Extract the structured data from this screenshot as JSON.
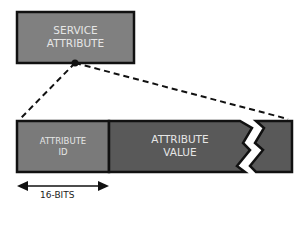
{
  "diagram": {
    "top_box": {
      "line1": "SERVICE",
      "line2": "ATTRIBUTE",
      "fill": "#808080"
    },
    "attribute_id": {
      "line1": "ATTRIBUTE",
      "line2": "ID",
      "fill": "#7a7a7a"
    },
    "attribute_value": {
      "line1": "ATTRIBUTE",
      "line2": "VALUE",
      "fill": "#595959"
    },
    "width_label": "16-BITS",
    "stroke": "#111111"
  }
}
